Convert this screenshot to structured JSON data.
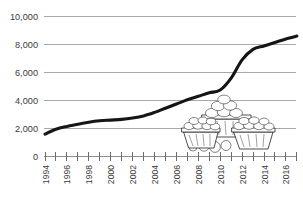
{
  "chart_data": {
    "type": "line",
    "title": "",
    "subtitle": "",
    "xlabel": "",
    "ylabel": "",
    "xlim": [
      1994,
      2017
    ],
    "ylim": [
      0,
      10000
    ],
    "grid": true,
    "legend": null,
    "legend_position": "none",
    "y_ticks": [
      0,
      2000,
      4000,
      6000,
      8000,
      10000
    ],
    "y_tick_labels": [
      "0",
      "2,000",
      "4,000",
      "6,000",
      "8,000",
      "10,000"
    ],
    "x_ticks": [
      1994,
      1995,
      1996,
      1997,
      1998,
      1999,
      2000,
      2001,
      2002,
      2003,
      2004,
      2005,
      2006,
      2007,
      2008,
      2009,
      2010,
      2011,
      2012,
      2013,
      2014,
      2015,
      2016,
      2017
    ],
    "x_tick_labels": [
      "1994",
      "1996",
      "1998",
      "2000",
      "2002",
      "2004",
      "2006",
      "2008",
      "2010",
      "2012",
      "2014",
      "2016"
    ],
    "x_tick_label_years": [
      1994,
      1996,
      1998,
      2000,
      2002,
      2004,
      2006,
      2008,
      2010,
      2012,
      2014,
      2016
    ],
    "x_tick_label_rotation": -90,
    "series": [
      {
        "name": "value",
        "color": "#151515",
        "x": [
          1994,
          1995,
          1996,
          1997,
          1998,
          1999,
          2000,
          2001,
          2002,
          2003,
          2004,
          2005,
          2006,
          2007,
          2008,
          2009,
          2010,
          2011,
          2012,
          2013,
          2014,
          2015,
          2016,
          2017
        ],
        "values": [
          1600,
          1950,
          2150,
          2300,
          2450,
          2550,
          2600,
          2650,
          2750,
          2900,
          3150,
          3450,
          3750,
          4050,
          4300,
          4550,
          4750,
          5600,
          6900,
          7650,
          7900,
          8150,
          8400,
          8600
        ]
      }
    ],
    "annotations": [
      {
        "type": "illustration",
        "name": "fruit-baskets-illustration",
        "description": "Line drawing of three woven baskets filled with fruit, with loose round fruit in front",
        "x_range": [
          2008.2,
          2015.6
        ],
        "y_range": [
          300,
          3900
        ]
      }
    ]
  },
  "axis": {
    "y_axis_name": "y-axis",
    "x_axis_name": "x-axis"
  },
  "colors": {
    "line": "#151515",
    "gridline": "#a8a8a8",
    "axis": "#8e8e8e",
    "tick_label": "#3a3a3a",
    "background": "#ffffff"
  }
}
